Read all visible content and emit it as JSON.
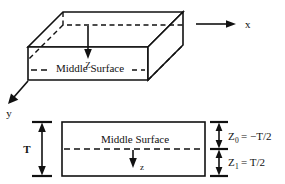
{
  "figure": {
    "colors": {
      "ink": "#111111",
      "background": "#ffffff"
    },
    "top_view": {
      "name": "3d-plate-isometric",
      "middle_surface_label": "Middle Surface",
      "axes": [
        {
          "id": "x",
          "label": "x",
          "direction": "right"
        },
        {
          "id": "y",
          "label": "y",
          "direction": "down-left"
        },
        {
          "id": "z",
          "label": "Z",
          "direction": "down"
        }
      ]
    },
    "bottom_view": {
      "name": "cross-section",
      "middle_surface_label": "Middle  Surface",
      "thickness_label": "T",
      "depth_axis_label": "z",
      "coordinates": [
        {
          "symbol": "Z",
          "subscript": "0",
          "equation": "= −T/2",
          "position": "top-half"
        },
        {
          "symbol": "Z",
          "subscript": "1",
          "equation": "= T/2",
          "position": "bottom-half"
        }
      ]
    }
  }
}
